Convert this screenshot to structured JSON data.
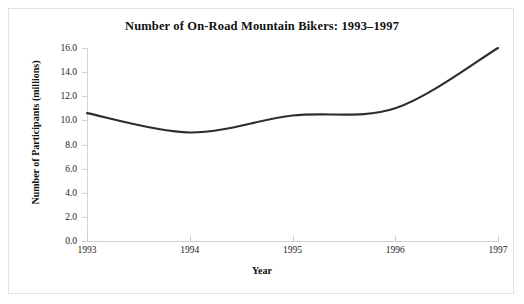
{
  "chart_data": {
    "type": "line",
    "title": "Number of On-Road Mountain Bikers: 1993–1997",
    "xlabel": "Year",
    "ylabel": "Number of Participants (millions)",
    "x": [
      1993,
      1994,
      1995,
      1996,
      1997
    ],
    "categories": [
      "1993",
      "1994",
      "1995",
      "1996",
      "1997"
    ],
    "values": [
      10.6,
      9.0,
      10.4,
      11.0,
      16.0
    ],
    "series": [
      {
        "name": "Participants",
        "values": [
          10.6,
          9.0,
          10.4,
          11.0,
          16.0
        ]
      }
    ],
    "xlim": [
      1993,
      1997
    ],
    "ylim": [
      0.0,
      16.0
    ],
    "ytick_labels": [
      "0.0",
      "2.0",
      "4.0",
      "6.0",
      "8.0",
      "10.0",
      "12.0",
      "14.0",
      "16.0"
    ],
    "ytick_values": [
      0.0,
      2.0,
      4.0,
      6.0,
      8.0,
      10.0,
      12.0,
      14.0,
      16.0
    ],
    "xtick_labels": [
      "1993",
      "1994",
      "1995",
      "1996",
      "1997"
    ],
    "grid": false,
    "legend": "none",
    "line_color": "#2d2d2d",
    "line_width": 2.1,
    "smoothing": "spline",
    "axis_color": "#d0d0d0",
    "background_color": "#ffffff",
    "border_color": "#e2e2e2"
  }
}
